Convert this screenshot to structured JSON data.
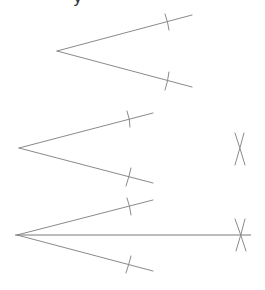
{
  "header": {
    "cropped_glyph": "y"
  },
  "diagram": {
    "line_color": "#8a8a8a",
    "steps": [
      {
        "step": 1,
        "vertex": [
          57,
          51
        ],
        "upper_ray_end": [
          192,
          15
        ],
        "lower_ray_end": [
          192,
          87
        ],
        "arc_marks": [
          [
            167,
            22
          ],
          [
            167,
            80
          ]
        ],
        "crossing_arcs": null,
        "bisector": null
      },
      {
        "step": 2,
        "vertex": [
          19,
          148
        ],
        "upper_ray_end": [
          153,
          113
        ],
        "lower_ray_end": [
          153,
          183
        ],
        "arc_marks": [
          [
            129,
            119
          ],
          [
            129,
            177
          ]
        ],
        "crossing_arcs": [
          240,
          149
        ],
        "bisector": null
      },
      {
        "step": 3,
        "vertex": [
          17,
          235
        ],
        "upper_ray_end": [
          153,
          200
        ],
        "lower_ray_end": [
          153,
          271
        ],
        "arc_marks": [
          [
            129,
            206
          ],
          [
            129,
            264
          ]
        ],
        "crossing_arcs": [
          241,
          235
        ],
        "bisector": {
          "from": [
            15,
            235
          ],
          "to": [
            251,
            235
          ]
        }
      }
    ]
  }
}
